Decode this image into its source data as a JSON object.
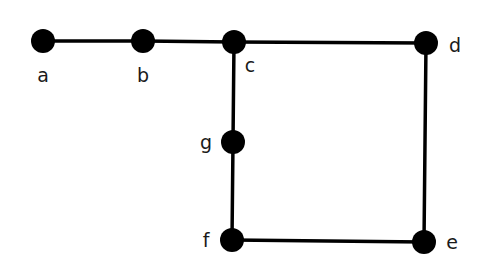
{
  "diagram": {
    "type": "undirected-graph",
    "colors": {
      "background": "#ffffff",
      "node": "#000000",
      "edge": "#000000",
      "label": "#1a1a1a"
    },
    "node_radius": 12,
    "edge_width": 3.5,
    "nodes": [
      {
        "id": "a",
        "label": "a",
        "x": 43,
        "y": 41,
        "label_x": 43,
        "label_y": 82,
        "anchor": "middle"
      },
      {
        "id": "b",
        "label": "b",
        "x": 143,
        "y": 41,
        "label_x": 143,
        "label_y": 82,
        "anchor": "middle"
      },
      {
        "id": "c",
        "label": "c",
        "x": 234,
        "y": 42,
        "label_x": 250,
        "label_y": 72,
        "anchor": "middle"
      },
      {
        "id": "d",
        "label": "d",
        "x": 426,
        "y": 43,
        "label_x": 455,
        "label_y": 52,
        "anchor": "middle"
      },
      {
        "id": "g",
        "label": "g",
        "x": 233,
        "y": 142,
        "label_x": 206,
        "label_y": 149,
        "anchor": "middle"
      },
      {
        "id": "f",
        "label": "f",
        "x": 232,
        "y": 240,
        "label_x": 206,
        "label_y": 247,
        "anchor": "middle"
      },
      {
        "id": "e",
        "label": "e",
        "x": 424,
        "y": 242,
        "label_x": 452,
        "label_y": 249,
        "anchor": "middle"
      }
    ],
    "edges": [
      {
        "from": "a",
        "to": "b"
      },
      {
        "from": "b",
        "to": "c"
      },
      {
        "from": "c",
        "to": "d"
      },
      {
        "from": "c",
        "to": "g"
      },
      {
        "from": "g",
        "to": "f"
      },
      {
        "from": "d",
        "to": "e"
      },
      {
        "from": "f",
        "to": "e"
      }
    ]
  }
}
